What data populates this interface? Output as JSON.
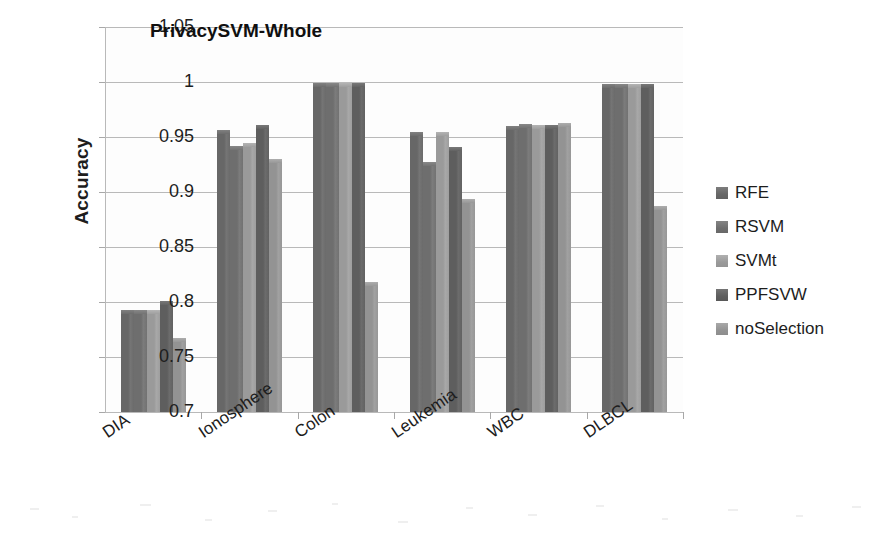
{
  "chart_data": {
    "type": "bar",
    "title": "PrivacySVM-Whole",
    "xlabel": "",
    "ylabel": "Accuracy",
    "ylim": [
      0.7,
      1.05
    ],
    "ytick_step": 0.05,
    "yticks": [
      "1.05",
      "1",
      "0.95",
      "0.9",
      "0.85",
      "0.8",
      "0.75",
      "0.7"
    ],
    "ytick_values": [
      1.05,
      1.0,
      0.95,
      0.9,
      0.85,
      0.8,
      0.75,
      0.7
    ],
    "grid": true,
    "legend_position": "right",
    "categories": [
      "DIA",
      "Ionosphere",
      "Colon",
      "Leukemia",
      "WBC",
      "DLBCL"
    ],
    "series": [
      {
        "name": "RFE",
        "color": "#676767",
        "values": [
          0.793,
          0.956,
          0.999,
          0.955,
          0.96,
          0.998
        ]
      },
      {
        "name": "RSVM",
        "color": "#6e6e6e",
        "values": [
          0.793,
          0.942,
          0.999,
          0.927,
          0.962,
          0.998
        ]
      },
      {
        "name": "SVMt",
        "color": "#9a9a9a",
        "values": [
          0.793,
          0.945,
          0.999,
          0.955,
          0.961,
          0.998
        ]
      },
      {
        "name": "PPFSVW",
        "color": "#5e5e5e",
        "values": [
          0.801,
          0.961,
          0.999,
          0.941,
          0.961,
          0.998
        ]
      },
      {
        "name": "noSelection",
        "color": "#939393",
        "values": [
          0.767,
          0.93,
          0.818,
          0.894,
          0.963,
          0.887
        ]
      }
    ]
  }
}
